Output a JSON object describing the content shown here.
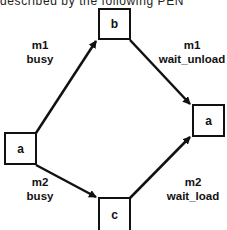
{
  "header": {
    "partial_text": "described by the following PEN"
  },
  "nodes": {
    "b": "b",
    "a_left": "a",
    "a_right": "a",
    "c": "c"
  },
  "edges": {
    "a_to_b": {
      "machine": "m1",
      "state": "busy"
    },
    "b_to_a": {
      "machine": "m1",
      "state": "wait_unload"
    },
    "a_to_c": {
      "machine": "m2",
      "state": "busy"
    },
    "c_to_a": {
      "machine": "m2",
      "state": "wait_load"
    }
  },
  "colors": {
    "stroke": "#111111",
    "background": "#ffffff"
  }
}
